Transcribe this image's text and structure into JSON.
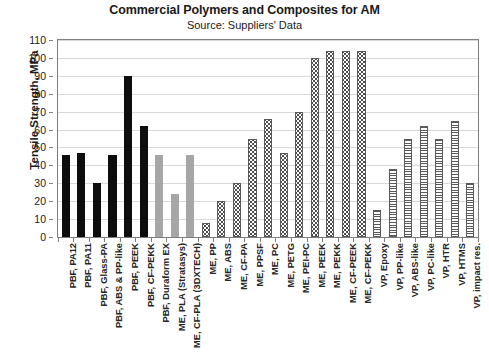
{
  "chart_data": {
    "type": "bar",
    "title": "Commercial Polymers and Composites for AM",
    "subtitle": "Source: Suppliers' Data",
    "xlabel": "",
    "ylabel": "Tensile Strength, MPa",
    "ylim": [
      0,
      110
    ],
    "ytick_step": 10,
    "yticks": [
      "110",
      "100",
      "90",
      "80",
      "70",
      "60",
      "50",
      "40",
      "30",
      "20",
      "10",
      "0"
    ],
    "grid": true,
    "legend": "none",
    "categories": [
      "PBF, PA12",
      "PBF, PA11",
      "PBF, Glass-PA",
      "PBF, ABS & PP-like",
      "PBF, PEEK",
      "PBF, CF-PEKK",
      "PBF, Duraform EX",
      "ME, PLA (Stratasys)",
      "ME, CF-PLA (3DXTECH)",
      "ME, PP",
      "ME, ABS",
      "ME, CF-PA",
      "ME, PPSF",
      "ME, PC",
      "ME, PETG",
      "ME, PEI-PC",
      "ME, PEEK",
      "ME, PEKK",
      "ME, CF-PEEK",
      "ME, CF-PEKK",
      "VP, Epoxy",
      "VP, PP-like",
      "VP, ABS-like",
      "VP, PC-like",
      "VP, HTR",
      "VP, HTMS",
      "VP, impact res."
    ],
    "values": [
      46,
      47,
      30,
      46,
      90,
      62,
      46,
      24,
      46,
      8,
      20,
      30,
      55,
      66,
      47,
      70,
      100,
      104,
      104,
      104,
      15,
      38,
      55,
      62,
      55,
      65,
      30
    ],
    "fills": [
      "solid-black",
      "solid-black",
      "solid-black",
      "solid-black",
      "solid-black",
      "solid-black",
      "solid-gray",
      "solid-gray",
      "solid-gray",
      "dotted",
      "dotted",
      "dotted",
      "dotted",
      "dotted",
      "dotted",
      "dotted",
      "dotted",
      "dotted",
      "dotted",
      "dotted",
      "horizontal-lines",
      "horizontal-lines",
      "horizontal-lines",
      "horizontal-lines",
      "horizontal-lines",
      "horizontal-lines",
      "horizontal-lines"
    ],
    "colors": {
      "solid-black": "#0d0d0d",
      "solid-gray": "#a6a6a6",
      "pattern-stroke": "#4d4d4d",
      "gridline": "#d9d9d9",
      "axis": "#7f7f7f",
      "text": "#1a1a1a"
    }
  }
}
